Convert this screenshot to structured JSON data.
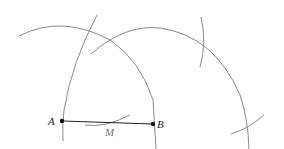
{
  "diagram": {
    "points": [
      {
        "id": "A",
        "label": "A",
        "x": 62,
        "y": 121
      },
      {
        "id": "B",
        "label": "B",
        "x": 153,
        "y": 124
      },
      {
        "id": "M",
        "label": "M",
        "x": 108,
        "y": 123
      }
    ],
    "segment": {
      "from": "A",
      "to": "B"
    },
    "colors": {
      "arc": "#8a8a8a",
      "segment": "#222222",
      "point": "#111111",
      "label": "#222222",
      "label_m": "#777777"
    }
  }
}
